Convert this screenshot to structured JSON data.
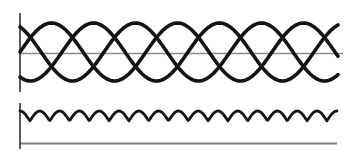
{
  "figure": {
    "name": "three-phase-ac-and-rectified-ripple",
    "background": "#ffffff",
    "width": 352,
    "height": 155,
    "top_panel": {
      "name": "three-phase-ac-waveform",
      "vertical_axis": {
        "x": 20,
        "y1": 13,
        "y2": 92,
        "color": "#2f2f2f",
        "stroke_width": 1.6
      },
      "zero_axis": {
        "y": 53.5,
        "x1": 20,
        "x2": 343,
        "color": "#8c8c8c",
        "stroke_width": 1.6
      },
      "sine_braid": {
        "x1": 20,
        "x2": 339,
        "center_y": 52,
        "amplitude": 29,
        "period_px": 126,
        "phases_deg": [
          0,
          120,
          240
        ],
        "stroke": "#141414",
        "stroke_width": 3.6
      }
    },
    "bottom_panel": {
      "name": "rectified-dc-ripple-waveform",
      "vertical_axis": {
        "x": 20,
        "y1": 103,
        "y2": 149,
        "color": "#2f2f2f",
        "stroke_width": 1.6
      },
      "baseline": {
        "y": 143.5,
        "x1": 20,
        "x2": 337,
        "color": "#7d7d7d",
        "stroke_width": 1.8
      },
      "ripple": {
        "x1": 20,
        "x2": 337,
        "cusp_y": 121,
        "top_y": 111,
        "half_period_px": 19.8,
        "stroke": "#161616",
        "stroke_width": 2.8
      }
    }
  },
  "chart_data": {
    "type": "line",
    "title": "",
    "series": [
      {
        "name": "phase-1-sine",
        "waveform": "sine",
        "cycles_shown": 2.5,
        "phase_deg": 0,
        "relative_amplitude": 1
      },
      {
        "name": "phase-2-sine",
        "waveform": "sine",
        "cycles_shown": 2.5,
        "phase_deg": 120,
        "relative_amplitude": 1
      },
      {
        "name": "phase-3-sine",
        "waveform": "sine",
        "cycles_shown": 2.5,
        "phase_deg": 240,
        "relative_amplitude": 1
      },
      {
        "name": "rectified-ripple",
        "waveform": "abs-cosine-scallops",
        "humps_shown": 16,
        "relative_amplitude": 0.17
      }
    ],
    "xlabel": "",
    "ylabel": "",
    "grid": false,
    "legend": false
  }
}
